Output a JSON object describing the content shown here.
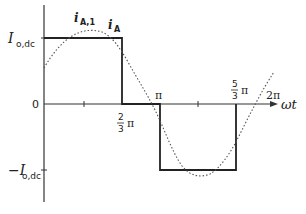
{
  "diagram": {
    "labels": {
      "y_pos": "I",
      "y_pos_sub": "o,dc",
      "y_neg": "−I",
      "y_neg_sub": "o,dc",
      "zero": "0",
      "fundamental": "i",
      "fundamental_sub": "A,1",
      "current": "i",
      "current_sub": "A",
      "two_thirds_num": "2",
      "two_thirds_den": "3",
      "pi": "π",
      "five_thirds_num": "5",
      "five_thirds_den": "3",
      "two_pi": "2π",
      "x_axis": "ωt"
    },
    "waveforms": [
      {
        "name": "i_A",
        "style": "solid",
        "shape": "square",
        "segments": [
          {
            "from": "0",
            "to": "2/3 π",
            "level": "+I_o,dc"
          },
          {
            "from": "2/3 π",
            "to": "π",
            "level": "0"
          },
          {
            "from": "π",
            "to": "5/3 π",
            "level": "-I_o,dc"
          },
          {
            "from": "5/3 π",
            "to": "2π",
            "level": "0"
          }
        ]
      },
      {
        "name": "i_A,1",
        "style": "dotted",
        "shape": "sine",
        "phase_shift": "-π/6"
      }
    ],
    "colors": {
      "line": "#333333",
      "dotted": "#666666"
    }
  }
}
